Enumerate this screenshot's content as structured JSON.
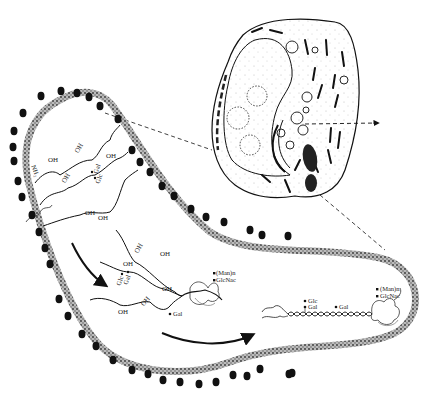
{
  "figure": {
    "type": "biological illustration",
    "colors": {
      "ink": "#111111",
      "background": "#ffffff",
      "membrane": "#555555"
    }
  },
  "cell": {
    "label_arrow": "secretion-direction-arrow"
  },
  "chains": {
    "oh_label": "OH",
    "nh_label": "NH₂",
    "gal_label": "Gal",
    "glc_label": "Glc",
    "man_label": "(Man)n",
    "glcnac_label": "GlcNac"
  },
  "triple_helix": {
    "glc_label": "Glc",
    "gal_label_1": "Gal",
    "gal_label_2": "Gal",
    "man_label": "(Man)n",
    "glcnac_label": "GlcNac"
  }
}
